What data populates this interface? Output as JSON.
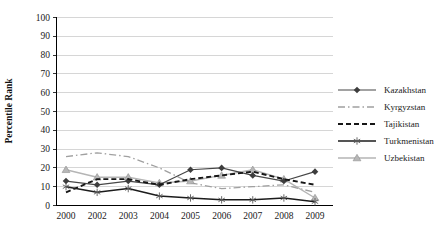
{
  "chart_data": {
    "type": "line",
    "title": "",
    "xlabel": "",
    "ylabel": "Percentile Rank",
    "ylim": [
      0,
      100
    ],
    "ytick_step": 10,
    "grid": "horizontal",
    "legend_position": "right",
    "categories": [
      "2000",
      "2002",
      "2003",
      "2004",
      "2005",
      "2006",
      "2007",
      "2008",
      "2009"
    ],
    "series": [
      {
        "name": "Kazakhstan",
        "values": [
          13,
          11,
          13,
          11,
          19,
          20,
          16,
          13,
          18
        ],
        "line": "solid",
        "marker": "diamond",
        "color": "#474747"
      },
      {
        "name": "Kyrgyzstan",
        "values": [
          26,
          28,
          26,
          20,
          12,
          9,
          10,
          11,
          7
        ],
        "line": "dashdot",
        "marker": "none",
        "color": "#a0a0a0"
      },
      {
        "name": "Tajikistan",
        "values": [
          7,
          14,
          14,
          11,
          14,
          16,
          18,
          14,
          11
        ],
        "line": "dashed",
        "marker": "none",
        "color": "#161616"
      },
      {
        "name": "Turkmenistan",
        "values": [
          10,
          7,
          9,
          5,
          4,
          3,
          3,
          4,
          2
        ],
        "line": "solid",
        "marker": "asterisk",
        "color": "#1c1c1c"
      },
      {
        "name": "Uzbekistan",
        "values": [
          19,
          15,
          15,
          12,
          13,
          16,
          19,
          14,
          4
        ],
        "line": "solid",
        "marker": "triangle",
        "color": "#b5b5b5"
      }
    ],
    "marker_colors": {
      "diamond_fill": "#3d3d3d",
      "asterisk_stroke": "#5a5a5a",
      "triangle_fill": "#b7b7b7",
      "triangle_edge": "#8f8f8f"
    },
    "axis_color": "#000000",
    "gridline_color": "#cccccc",
    "text_color": "#1a1a1a"
  }
}
